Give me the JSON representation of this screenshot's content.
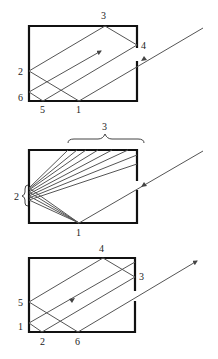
{
  "figure": {
    "panels": [
      {
        "id": "top",
        "labels": [
          "1",
          "2",
          "3",
          "4",
          "5",
          "6"
        ],
        "arrow_direction": "incoming ray, then internal arrow pointing up-right"
      },
      {
        "id": "middle",
        "labels": [
          "1",
          "2",
          "3"
        ],
        "brace_labels": {
          "top": "3",
          "left": "2"
        }
      },
      {
        "id": "bottom",
        "labels": [
          "1",
          "2",
          "3",
          "4",
          "5",
          "6"
        ],
        "arrow_direction": "ray exits through slit pointing up-right"
      }
    ]
  },
  "labels": {
    "top": {
      "l1": "1",
      "l2": "2",
      "l3": "3",
      "l4": "4",
      "l5": "5",
      "l6": "6"
    },
    "middle": {
      "l1": "1",
      "l2": "2",
      "l3": "3"
    },
    "bottom": {
      "l1": "1",
      "l2": "2",
      "l3": "3",
      "l4": "4",
      "l5": "5",
      "l6": "6"
    }
  }
}
